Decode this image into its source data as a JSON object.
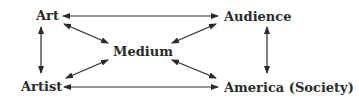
{
  "diagram": {
    "nodes": {
      "art": "Art",
      "audience": "Audience",
      "medium": "Medium",
      "artist": "Artist",
      "america": "America (Society)"
    },
    "edges": [
      {
        "from": "Art",
        "to": "Audience",
        "type": "bidirectional"
      },
      {
        "from": "Art",
        "to": "Artist",
        "type": "bidirectional"
      },
      {
        "from": "Art",
        "to": "Medium",
        "type": "bidirectional"
      },
      {
        "from": "Audience",
        "to": "Medium",
        "type": "bidirectional"
      },
      {
        "from": "Audience",
        "to": "America (Society)",
        "type": "bidirectional"
      },
      {
        "from": "Artist",
        "to": "Medium",
        "type": "bidirectional"
      },
      {
        "from": "Artist",
        "to": "America (Society)",
        "type": "bidirectional"
      },
      {
        "from": "America (Society)",
        "to": "Medium",
        "type": "bidirectional"
      }
    ],
    "colors": {
      "text": "#2a2a2a",
      "arrow": "#2a2a2a",
      "background": "#ffffff"
    }
  }
}
